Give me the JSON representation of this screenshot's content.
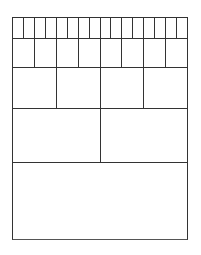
{
  "diagram": {
    "type": "binary-subdivision-grid",
    "line_color": "#333333",
    "background": "#ffffff",
    "rows": [
      {
        "cells": 16,
        "top": 0,
        "height": 21
      },
      {
        "cells": 8,
        "top": 21,
        "height": 29
      },
      {
        "cells": 4,
        "top": 50,
        "height": 41
      },
      {
        "cells": 2,
        "top": 91,
        "height": 54
      },
      {
        "cells": 1,
        "top": 145,
        "height": 78
      }
    ]
  }
}
